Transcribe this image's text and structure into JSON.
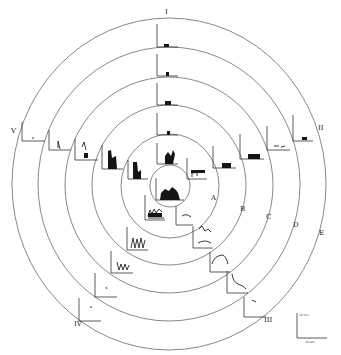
{
  "figure": {
    "type": "concentric-ring diagram with embedded recording traces",
    "rings": [
      {
        "label": "A"
      },
      {
        "label": "B"
      },
      {
        "label": "C"
      },
      {
        "label": "D"
      },
      {
        "label": "E"
      }
    ],
    "sectors": [
      {
        "label": "I"
      },
      {
        "label": "II"
      },
      {
        "label": "III"
      },
      {
        "label": "IV"
      },
      {
        "label": "V"
      }
    ],
    "scale_bar": {
      "vertical_label": "10 mv",
      "horizontal_label": "10 sec"
    }
  }
}
